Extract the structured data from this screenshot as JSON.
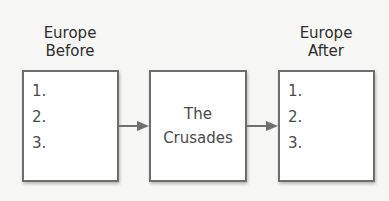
{
  "diagram": {
    "left": {
      "title_line1": "Europe",
      "title_line2": "Before",
      "items": [
        "1.",
        "2.",
        "3."
      ]
    },
    "middle": {
      "line1": "The",
      "line2": "Crusades"
    },
    "right": {
      "title_line1": "Europe",
      "title_line2": "After",
      "items": [
        "1.",
        "2.",
        "3."
      ]
    },
    "colors": {
      "border": "#6e6e6e",
      "arrow": "#707070",
      "background": "#f7f7f5"
    }
  }
}
